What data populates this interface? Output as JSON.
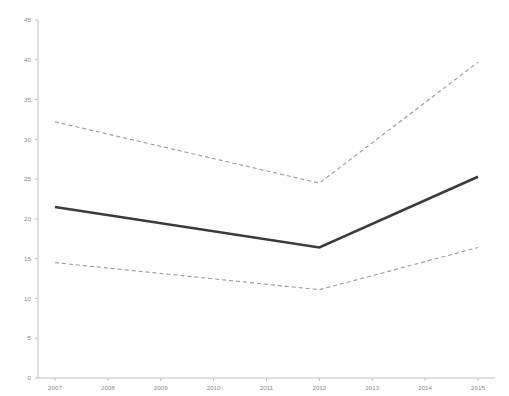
{
  "chart_data": {
    "type": "line",
    "title": "",
    "subtitle": "",
    "xlabel": "",
    "ylabel": "",
    "x": [
      2007,
      2008,
      2009,
      2010,
      2011,
      2012,
      2013,
      2014,
      2015
    ],
    "categories": [
      "2007",
      "2008",
      "2009",
      "2010",
      "2011",
      "2012",
      "2013",
      "2014",
      "2015"
    ],
    "xlim": [
      2007,
      2015
    ],
    "ylim": [
      0,
      45
    ],
    "y_ticks": [
      0,
      5,
      10,
      15,
      20,
      25,
      30,
      35,
      40,
      45
    ],
    "y_tick_labels": [
      "0",
      "5",
      "10",
      "15",
      "20",
      "25",
      "30",
      "35",
      "40",
      "45"
    ],
    "x_ticks": [
      2007,
      2008,
      2009,
      2010,
      2011,
      2012,
      2013,
      2014,
      2015
    ],
    "x_tick_labels": [
      "2007",
      "2008",
      "2009",
      "2010",
      "2011",
      "2012",
      "2013",
      "2014",
      "2015"
    ],
    "grid": false,
    "legend": "none",
    "breakpoint_year": 2012,
    "series": [
      {
        "name": "upper-confidence-limit",
        "style": "dashed",
        "color": "#9a9a9a",
        "x": [
          2007,
          2012,
          2015
        ],
        "values": [
          32.2,
          24.5,
          39.7
        ]
      },
      {
        "name": "fitted-trend",
        "style": "solid",
        "color": "#3b3b3b",
        "x": [
          2007,
          2012,
          2015
        ],
        "values": [
          21.5,
          16.4,
          25.3
        ]
      },
      {
        "name": "lower-confidence-limit",
        "style": "dashed",
        "color": "#9a9a9a",
        "x": [
          2007,
          2012,
          2015
        ],
        "values": [
          14.5,
          11.1,
          16.4
        ]
      }
    ]
  },
  "style": {
    "axis_color": "#bfbfbf",
    "tick_label_color": "#8a8a8a",
    "solid_series_color": "#3b3b3b",
    "dashed_series_color": "#9a9a9a",
    "background": "#ffffff"
  }
}
